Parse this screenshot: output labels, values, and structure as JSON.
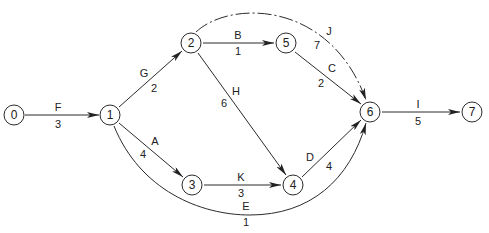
{
  "diagram": {
    "type": "activity-on-arrow network",
    "nodes": [
      {
        "id": "0",
        "label": "0",
        "x": 14,
        "y": 115
      },
      {
        "id": "1",
        "label": "1",
        "x": 110,
        "y": 115
      },
      {
        "id": "2",
        "label": "2",
        "x": 191,
        "y": 43
      },
      {
        "id": "3",
        "label": "3",
        "x": 192,
        "y": 185
      },
      {
        "id": "4",
        "label": "4",
        "x": 293,
        "y": 185
      },
      {
        "id": "5",
        "label": "5",
        "x": 286,
        "y": 43
      },
      {
        "id": "6",
        "label": "6",
        "x": 370,
        "y": 112
      },
      {
        "id": "7",
        "label": "7",
        "x": 472,
        "y": 112
      }
    ],
    "edges": [
      {
        "activity": "F",
        "duration": "3",
        "from": "0",
        "to": "1"
      },
      {
        "activity": "G",
        "duration": "2",
        "from": "1",
        "to": "2"
      },
      {
        "activity": "A",
        "duration": "4",
        "from": "1",
        "to": "3"
      },
      {
        "activity": "E",
        "duration": "1",
        "from": "1",
        "to": "6"
      },
      {
        "activity": "B",
        "duration": "1",
        "from": "2",
        "to": "5"
      },
      {
        "activity": "H",
        "duration": "6",
        "from": "2",
        "to": "4"
      },
      {
        "activity": "J",
        "duration": "7",
        "from": "2",
        "to": "6"
      },
      {
        "activity": "K",
        "duration": "3",
        "from": "3",
        "to": "4"
      },
      {
        "activity": "C",
        "duration": "2",
        "from": "5",
        "to": "6"
      },
      {
        "activity": "D",
        "duration": "4",
        "from": "4",
        "to": "6"
      },
      {
        "activity": "I",
        "duration": "5",
        "from": "6",
        "to": "7"
      }
    ]
  }
}
